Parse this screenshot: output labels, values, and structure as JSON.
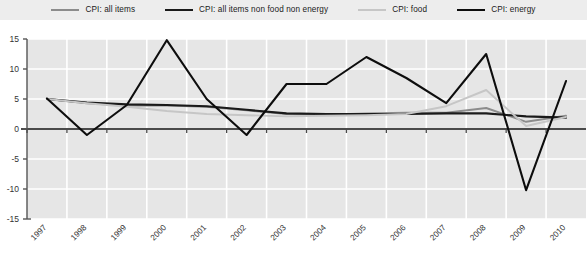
{
  "legend": {
    "position": "top",
    "items": [
      {
        "label": "CPI: all items",
        "color": "#8c8c8c",
        "width": 2.2
      },
      {
        "label": "CPI: all items non food non energy",
        "color": "#1a1a1a",
        "width": 2.6
      },
      {
        "label": "CPI: food",
        "color": "#c6c6c6",
        "width": 2.2
      },
      {
        "label": "CPI: energy",
        "color": "#0d0d0d",
        "width": 2.6
      }
    ]
  },
  "axes": {
    "y_ticks": [
      "15",
      "10",
      "5",
      "0",
      "-5",
      "-10",
      "-15"
    ],
    "x_ticks": [
      "1997",
      "1998",
      "1999",
      "2000",
      "2001",
      "2002",
      "2003",
      "2004",
      "2005",
      "2006",
      "2007",
      "2008",
      "2009",
      "2010"
    ]
  },
  "colors": {
    "plot_background": "#e6e6e6",
    "gridline": "#ffffff",
    "axis": "#555555",
    "zero_line": "#4a4a4a",
    "legend_background": "#ededed",
    "page_background": "#ffffff"
  },
  "chart_data": {
    "type": "line",
    "title": "",
    "subtitle": "",
    "xlabel": "",
    "ylabel": "",
    "ylim": [
      -15,
      15
    ],
    "yticks": [
      15,
      10,
      5,
      0,
      -5,
      -10,
      -15
    ],
    "grid": true,
    "legend_position": "top",
    "categories": [
      "1997",
      "1998",
      "1999",
      "2000",
      "2001",
      "2002",
      "2003",
      "2004",
      "2005",
      "2006",
      "2007",
      "2008",
      "2009",
      "2010"
    ],
    "series": [
      {
        "name": "CPI: all items",
        "color": "#8c8c8c",
        "values": [
          5.0,
          4.3,
          3.9,
          3.9,
          3.7,
          3.1,
          2.5,
          2.4,
          2.6,
          2.7,
          2.7,
          3.5,
          1.2,
          2.2
        ]
      },
      {
        "name": "CPI: all items non food non energy",
        "color": "#1a1a1a",
        "values": [
          5.0,
          4.4,
          4.1,
          4.0,
          3.8,
          3.2,
          2.6,
          2.5,
          2.5,
          2.5,
          2.6,
          2.6,
          2.1,
          1.9
        ]
      },
      {
        "name": "CPI: food",
        "color": "#c6c6c6",
        "values": [
          5.0,
          4.3,
          3.7,
          3.0,
          2.5,
          2.3,
          2.1,
          2.2,
          2.3,
          2.5,
          3.8,
          6.5,
          0.5,
          2.0
        ]
      },
      {
        "name": "CPI: energy",
        "color": "#0d0d0d",
        "values": [
          5.1,
          -1.0,
          4.0,
          14.8,
          5.0,
          -1.0,
          7.5,
          7.5,
          12.0,
          8.5,
          4.3,
          12.5,
          -10.2,
          8.0
        ]
      }
    ]
  },
  "caption": ""
}
